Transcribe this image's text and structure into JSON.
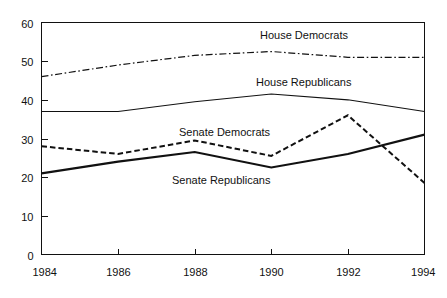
{
  "chart_data": {
    "type": "line",
    "title": "",
    "subtitle": "",
    "xlabel": "",
    "ylabel": "",
    "x": [
      1984,
      1986,
      1988,
      1990,
      1992,
      1994
    ],
    "xtick_labels": [
      "1984",
      "1986",
      "1988",
      "1990",
      "1992",
      "1994"
    ],
    "ytick_labels": [
      "0",
      "10",
      "20",
      "30",
      "40",
      "50",
      "60"
    ],
    "yticks": [
      0,
      10,
      20,
      30,
      40,
      50,
      60
    ],
    "xlim": [
      1984,
      1994
    ],
    "ylim": [
      0,
      60
    ],
    "grid": false,
    "legend_position": "inline-annotations",
    "series": [
      {
        "name": "House Democrats",
        "style": "dash-dot",
        "color": "#111111",
        "values": [
          46,
          49,
          51.5,
          52.5,
          51,
          51
        ]
      },
      {
        "name": "House Republicans",
        "style": "solid-thin",
        "color": "#111111",
        "values": [
          37,
          37,
          39.5,
          41.5,
          40,
          37
        ]
      },
      {
        "name": "Senate Democrats",
        "style": "dashed",
        "color": "#111111",
        "values": [
          28,
          26,
          29.5,
          25.5,
          36,
          18.5
        ]
      },
      {
        "name": "Senate Republicans",
        "style": "solid-thick",
        "color": "#111111",
        "values": [
          21,
          24,
          26.5,
          22.5,
          26,
          31
        ]
      }
    ],
    "annotations": [
      {
        "text": "House Democrats",
        "x_px": 260,
        "y_px": 39
      },
      {
        "text": "House Republicans",
        "x_px": 256,
        "y_px": 86
      },
      {
        "text": "Senate Democrats",
        "x_px": 179,
        "y_px": 136
      },
      {
        "text": "Senate Republicans",
        "x_px": 172,
        "y_px": 184
      }
    ]
  }
}
